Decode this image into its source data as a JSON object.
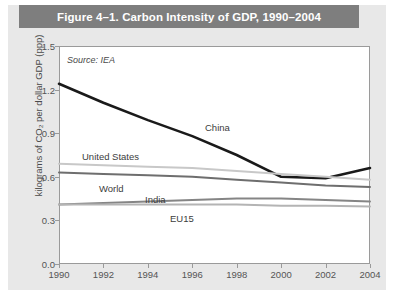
{
  "figure": {
    "title": "Figure 4–1. Carbon Intensity of GDP, 1990–2004",
    "source_note": "Source: IEA",
    "banner_color": "#7e7e7e",
    "background_color": "#e8e8e8",
    "plot_background_color": "#ffffff"
  },
  "chart_data": {
    "type": "line",
    "title": "Figure 4–1. Carbon Intensity of GDP, 1990–2004",
    "xlabel": "",
    "ylabel": "kilograms of CO2 per dollar GDP (ppp)",
    "ylabel_display": "kilograms of CO₂ per dollar GDP (ppp)",
    "annotation": "Source: IEA",
    "grid": false,
    "legend": "inline-labels",
    "xlim": [
      1990,
      2004
    ],
    "ylim": [
      0.0,
      1.5
    ],
    "yticks": [
      "0.0",
      "0.3",
      "0.6",
      "0.9",
      "1.2",
      "1.5"
    ],
    "ytick_values": [
      0.0,
      0.3,
      0.6,
      0.9,
      1.2,
      1.5
    ],
    "xticks": [
      "1990",
      "1992",
      "1994",
      "1996",
      "1998",
      "2000",
      "2002",
      "2004"
    ],
    "xtick_values": [
      1990,
      1992,
      1994,
      1996,
      1998,
      2000,
      2002,
      2004
    ],
    "x": [
      1990,
      1992,
      1994,
      1996,
      1998,
      2000,
      2002,
      2004
    ],
    "series": [
      {
        "name": "China",
        "color": "#1a1a1a",
        "width": 2.6,
        "values": [
          1.24,
          1.11,
          0.99,
          0.88,
          0.75,
          0.6,
          0.59,
          0.66
        ]
      },
      {
        "name": "United States",
        "color": "#c8c8c8",
        "width": 2.0,
        "values": [
          0.69,
          0.68,
          0.67,
          0.66,
          0.64,
          0.62,
          0.6,
          0.58
        ]
      },
      {
        "name": "World",
        "color": "#6e6e6e",
        "width": 2.0,
        "values": [
          0.63,
          0.62,
          0.61,
          0.6,
          0.58,
          0.56,
          0.54,
          0.53
        ]
      },
      {
        "name": "India",
        "color": "#858585",
        "width": 2.0,
        "values": [
          0.41,
          0.42,
          0.43,
          0.44,
          0.45,
          0.45,
          0.44,
          0.43
        ]
      },
      {
        "name": "EU15",
        "color": "#b4b4b4",
        "width": 2.0,
        "values": [
          0.41,
          0.41,
          0.41,
          0.41,
          0.41,
          0.4,
          0.4,
          0.395
        ]
      }
    ],
    "series_labels": [
      {
        "name": "China",
        "x": 205,
        "y": 122
      },
      {
        "name": "United States",
        "x": 82,
        "y": 151
      },
      {
        "name": "World",
        "x": 99,
        "y": 183
      },
      {
        "name": "India",
        "x": 145,
        "y": 194
      },
      {
        "name": "EU15",
        "x": 170,
        "y": 213
      }
    ]
  }
}
